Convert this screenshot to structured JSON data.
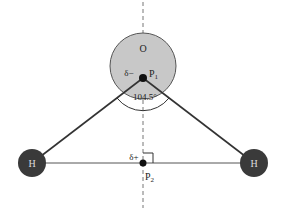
{
  "diagram": {
    "oxygen": {
      "label": "O",
      "cx": 143,
      "cy": 66,
      "r": 33,
      "fill": "#c8c8c8",
      "stroke": "#555555"
    },
    "hydrogens": [
      {
        "label": "H",
        "cx": 32,
        "cy": 163,
        "r": 14,
        "fill": "#3a3a3a"
      },
      {
        "label": "H",
        "cx": 254,
        "cy": 163,
        "r": 14,
        "fill": "#3a3a3a"
      }
    ],
    "points": [
      {
        "label": "P1",
        "cx": 143,
        "cy": 78,
        "charge_label": "δ−"
      },
      {
        "label": "P2",
        "cx": 143,
        "cy": 163,
        "charge_label": "δ+"
      }
    ],
    "angle_label": "104.5°",
    "axis": {
      "style": "dashed",
      "x": 143
    }
  }
}
